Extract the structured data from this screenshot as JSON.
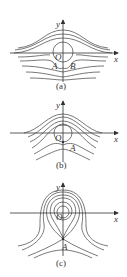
{
  "figure": {
    "panels": [
      {
        "id": "a",
        "caption": "(a)",
        "axis_x_label": "x",
        "axis_y_label": "y",
        "origin_label": "O",
        "points": [
          {
            "label": "A"
          },
          {
            "label": "B"
          }
        ],
        "description": "Two separate fixed points A and B below origin; streamlines flow around a closed circle near origin"
      },
      {
        "id": "b",
        "caption": "(b)",
        "axis_x_label": "x",
        "axis_y_label": "y",
        "origin_label": "O",
        "points": [
          {
            "label": "A"
          }
        ],
        "description": "Single merged point A on the circle; trajectories bend around"
      },
      {
        "id": "c",
        "caption": "(c)",
        "axis_x_label": "x",
        "axis_y_label": "y",
        "origin_label": "O",
        "points": [
          {
            "label": "A"
          }
        ],
        "description": "Nested closed orbits around O with saddle point A below; separatrix loop"
      }
    ]
  }
}
